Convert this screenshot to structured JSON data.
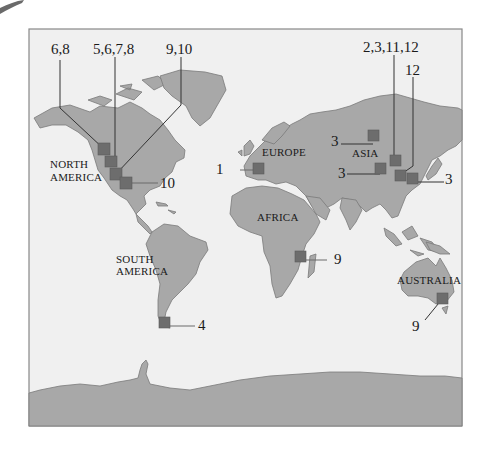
{
  "map": {
    "colors": {
      "water": "#f0f0f0",
      "land": "#a8a8a8",
      "marker": "#6d6d6d",
      "frame": "#888888"
    },
    "continents": {
      "north_america": [
        "NORTH",
        "AMERICA"
      ],
      "south_america": [
        "SOUTH",
        "AMERICA"
      ],
      "europe": "EUROPE",
      "asia": "ASIA",
      "africa": "AFRICA",
      "australia": "AUSTRALIA"
    },
    "callouts": {
      "na_1": "6,8",
      "na_2": "5,6,7,8",
      "na_3": "9,10",
      "na_4": "10",
      "europe": "1",
      "asia_1": "2,3,11,12",
      "asia_2": "12",
      "asia_3": "3",
      "asia_4": "3",
      "asia_5": "3",
      "south_america": "4",
      "africa": "9",
      "australia": "9"
    }
  }
}
